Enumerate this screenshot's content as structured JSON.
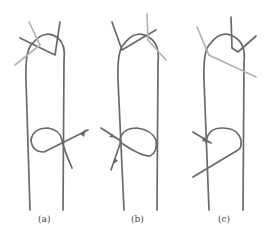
{
  "figure": {
    "panels": [
      {
        "id": "a",
        "caption": "(a)",
        "description": "Knot variant with crossing strands at top and arrowed strand at bottom right"
      },
      {
        "id": "b",
        "caption": "(b)",
        "description": "Knot variant with arrowed strands entering bottom left"
      },
      {
        "id": "c",
        "caption": "(c)",
        "description": "Knot variant with light strand crossing top loop and arrow at bottom left"
      }
    ],
    "colors": {
      "rope": "#6a6a6a",
      "rope_light": "#b4b4b4",
      "background": "#ffffff"
    }
  }
}
